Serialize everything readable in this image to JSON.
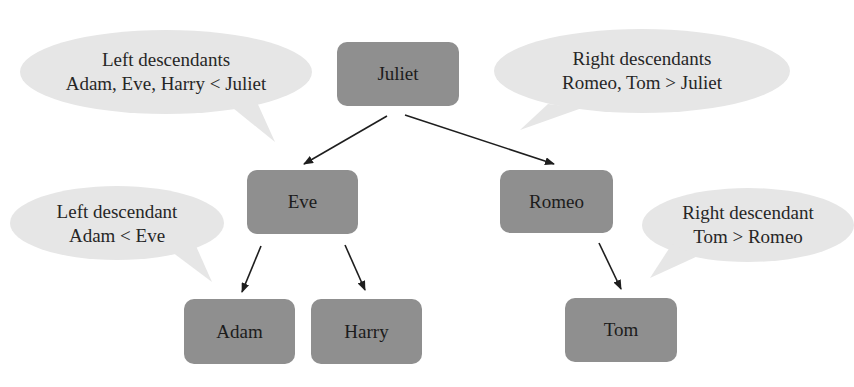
{
  "diagram": {
    "type": "binary-search-tree",
    "colors": {
      "node_fill": "#8f8f8f",
      "bubble_fill": "#e6e6e6",
      "arrow": "#1e1e1e",
      "text": "#1c1c1c"
    },
    "nodes": {
      "juliet": {
        "label": "Juliet"
      },
      "eve": {
        "label": "Eve"
      },
      "romeo": {
        "label": "Romeo"
      },
      "adam": {
        "label": "Adam"
      },
      "harry": {
        "label": "Harry"
      },
      "tom": {
        "label": "Tom"
      }
    },
    "edges": [
      {
        "from": "Juliet",
        "to": "Eve"
      },
      {
        "from": "Juliet",
        "to": "Romeo"
      },
      {
        "from": "Eve",
        "to": "Adam"
      },
      {
        "from": "Eve",
        "to": "Harry"
      },
      {
        "from": "Romeo",
        "to": "Tom"
      }
    ],
    "callouts": {
      "juliet_left": {
        "line1": "Left descendants",
        "line2": "Adam, Eve, Harry < Juliet"
      },
      "juliet_right": {
        "line1": "Right descendants",
        "line2": "Romeo, Tom > Juliet"
      },
      "eve_left": {
        "line1": "Left descendant",
        "line2": "Adam < Eve"
      },
      "romeo_right": {
        "line1": "Right descendant",
        "line2": "Tom > Romeo"
      }
    }
  }
}
